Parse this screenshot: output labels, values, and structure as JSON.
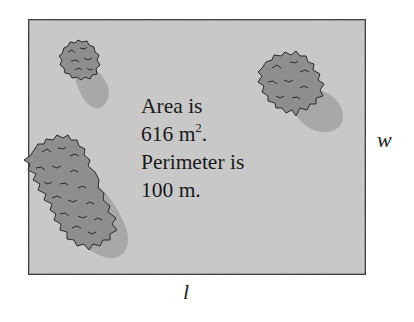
{
  "figure": {
    "rectangle": {
      "x": 28,
      "y": 19,
      "width": 338,
      "height": 256,
      "fill": "#c9c9c9",
      "stroke": "#2e2e2e"
    },
    "text": {
      "line1": "Area is",
      "line2_value": "616 m",
      "line2_sup": "2",
      "line2_end": ".",
      "line3": "Perimeter is",
      "line4": "100 m."
    },
    "labels": {
      "width": "w",
      "length": "l"
    },
    "bushes": [
      {
        "name": "small-bush",
        "cx": 80,
        "cy": 62,
        "rx": 20,
        "ry": 19
      },
      {
        "name": "right-bush",
        "cx": 292,
        "cy": 85,
        "rx": 34,
        "ry": 34
      },
      {
        "name": "large-bush",
        "cx": 68,
        "cy": 190,
        "rx": 40,
        "ry": 58
      }
    ],
    "colors": {
      "bush_fill": "#8e8e8e",
      "bush_outline": "#2a2a2a",
      "shadow": "#a8a8a8",
      "text": "#1a1a1a"
    }
  }
}
